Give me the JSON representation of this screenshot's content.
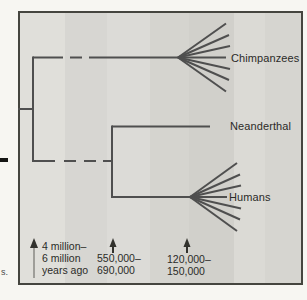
{
  "diagram": {
    "type": "phylogenetic-tree",
    "taxa": [
      {
        "label": "Chimpanzees"
      },
      {
        "label": "Neanderthal"
      },
      {
        "label": "Humans"
      }
    ],
    "divergence_markers": [
      {
        "lines": [
          "4 million–",
          "6 million",
          "years ago"
        ]
      },
      {
        "lines": [
          "550,000–",
          "690,000"
        ]
      },
      {
        "lines": [
          "120,000–",
          "150,000"
        ]
      }
    ],
    "colors": {
      "tree_line": "#4f4f4f",
      "box_border": "#45453f",
      "panel_background": "#d9d8d3",
      "text": "#2b2b28",
      "long_arrow_shaft": "#8a8983",
      "arrow_head": "#32322d"
    }
  },
  "margin_fragments": {
    "bottom_left": "s."
  }
}
